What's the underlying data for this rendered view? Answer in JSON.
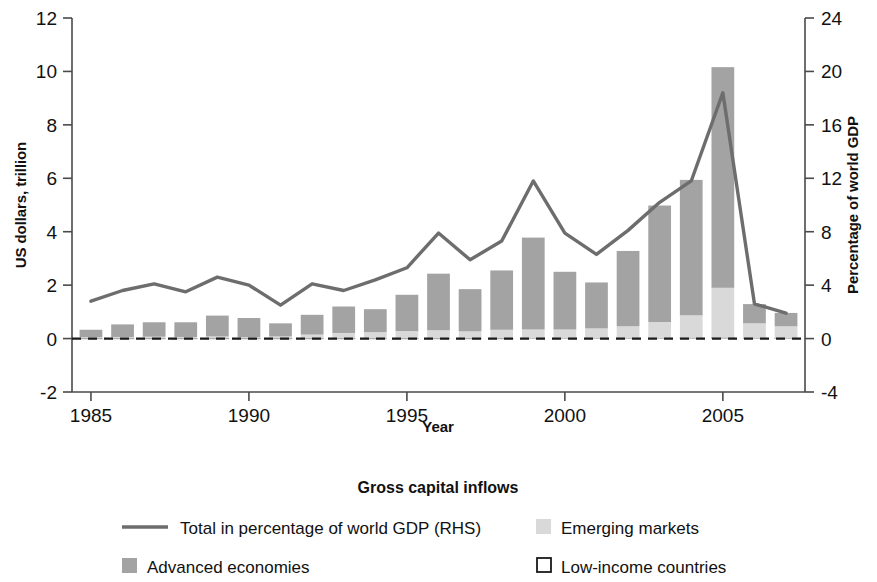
{
  "chart_data": {
    "type": "bar",
    "title": "Gross capital inflows",
    "xlabel": "Year",
    "ylabel": "US dollars, trillion",
    "y2label": "Percentage of world GDP",
    "ylim": [
      -2,
      12
    ],
    "y2lim": [
      -4,
      24
    ],
    "xlim": [
      1984.4,
      2007.6
    ],
    "yticks": [
      12,
      10,
      8,
      6,
      4,
      2,
      0,
      -2
    ],
    "ytick_labels": [
      "12",
      "10",
      "8",
      "6",
      "4",
      "2",
      "0",
      "-2"
    ],
    "y2ticks": [
      24,
      20,
      16,
      12,
      8,
      4,
      0,
      -4
    ],
    "y2tick_labels": [
      "24",
      "20",
      "16",
      "12",
      "8",
      "4",
      "0",
      "-4"
    ],
    "xticks": [
      1985,
      1990,
      1995,
      2000,
      2005
    ],
    "xtick_labels": [
      "1985",
      "1990",
      "1995",
      "2000",
      "2005"
    ],
    "grid": false,
    "zero_reference_line": true,
    "legend_position": "below",
    "categories": [
      1985,
      1986,
      1987,
      1988,
      1989,
      1990,
      1991,
      1992,
      1993,
      1994,
      1995,
      1996,
      1997,
      1998,
      1999,
      2000,
      2001,
      2002,
      2003,
      2004,
      2005,
      2006,
      2007
    ],
    "series": [
      {
        "name": "Advanced economies",
        "type": "bar-stacked",
        "color": "#a3a3a3",
        "values": [
          0.28,
          0.47,
          0.54,
          0.55,
          0.78,
          0.72,
          0.49,
          0.74,
          0.99,
          0.86,
          1.36,
          2.12,
          1.58,
          2.22,
          3.44,
          2.16,
          1.72,
          2.82,
          4.36,
          5.07,
          8.26,
          0.72,
          0.5
        ]
      },
      {
        "name": "Emerging markets",
        "type": "bar-stacked",
        "color": "#d9d9d9",
        "values": [
          0.04,
          0.05,
          0.06,
          0.05,
          0.07,
          0.04,
          0.07,
          0.14,
          0.2,
          0.23,
          0.27,
          0.3,
          0.26,
          0.32,
          0.32,
          0.32,
          0.36,
          0.44,
          0.6,
          0.84,
          1.86,
          0.55,
          0.44
        ]
      },
      {
        "name": "Low-income countries",
        "type": "bar-stacked",
        "color": "#ffffff",
        "values": [
          0.01,
          0.01,
          0.01,
          0.01,
          0.01,
          0.01,
          0.01,
          0.01,
          0.01,
          0.01,
          0.01,
          0.01,
          0.01,
          0.01,
          0.02,
          0.02,
          0.02,
          0.02,
          0.02,
          0.03,
          0.04,
          0.02,
          0.02
        ]
      },
      {
        "name": "Total in percentage of world GDP (RHS)",
        "type": "line",
        "axis": "right",
        "color": "#6d6d6d",
        "values": [
          2.8,
          3.6,
          4.1,
          3.5,
          4.6,
          4.0,
          2.5,
          4.1,
          3.6,
          4.4,
          5.3,
          7.9,
          5.9,
          7.3,
          11.8,
          7.9,
          6.3,
          8.1,
          10.2,
          11.8,
          18.4,
          2.6,
          1.9
        ]
      }
    ]
  },
  "legend": {
    "title": "Gross capital inflows",
    "items": [
      {
        "label": "Total in percentage of world GDP (RHS)",
        "marker": "line",
        "color": "#6d6d6d"
      },
      {
        "label": "Emerging markets",
        "marker": "square",
        "color": "#d9d9d9"
      },
      {
        "label": "Advanced economies",
        "marker": "square",
        "color": "#a3a3a3"
      },
      {
        "label": "Low-income countries",
        "marker": "square-outline",
        "color": "#ffffff"
      }
    ]
  }
}
